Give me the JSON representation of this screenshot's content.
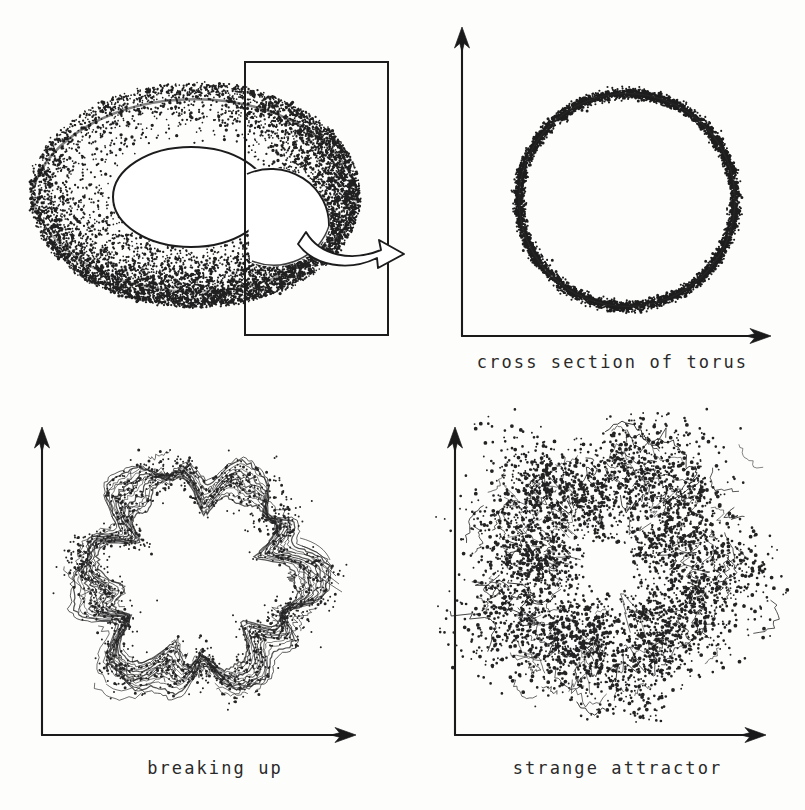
{
  "figure": {
    "background_color": "#fdfdfc",
    "ink_color": "#1a1a1a",
    "width": 805,
    "height": 810
  },
  "panels": [
    {
      "id": "torus",
      "name": "torus-with-cutting-plane",
      "caption": "",
      "has_axes": false,
      "elements": {
        "torus_label": "stippled torus",
        "cutting_plane_label": "cutting plane rectangle",
        "cut_face_label": "circular cut face",
        "arrow_label": "curved block arrow"
      }
    },
    {
      "id": "cross-section",
      "name": "cross-section-of-torus",
      "caption": "cross section of torus",
      "has_axes": true,
      "elements": {
        "curve_label": "dense circular ring of points"
      }
    },
    {
      "id": "breaking-up",
      "name": "breaking-up",
      "caption": "breaking up",
      "has_axes": true,
      "elements": {
        "curve_label": "wrinkled folded ring with wisps"
      }
    },
    {
      "id": "strange-attractor",
      "name": "strange-attractor",
      "caption": "strange attractor",
      "has_axes": true,
      "elements": {
        "curve_label": "diffuse fragmented annulus of dots and squiggles"
      }
    }
  ],
  "chart_data": {
    "type": "scatter",
    "panel_count": 4,
    "axis_ranges": {
      "x": [
        0,
        1
      ],
      "y": [
        0,
        1
      ]
    },
    "grid": false,
    "legend": false,
    "series": [
      {
        "name": "cross section of torus",
        "description": "invariant closed curve (quasi-periodic, smooth circle)",
        "center": [
          0.5,
          0.55
        ],
        "radius": 0.31,
        "radial_noise": 0.012,
        "point_count": 1500
      },
      {
        "name": "breaking up",
        "description": "wrinkled invariant curve beginning to fold and lose smoothness",
        "center": [
          0.5,
          0.52
        ],
        "radius": 0.3,
        "radial_noise": 0.075,
        "wrinkle_harmonics": [
          6,
          11,
          17
        ],
        "point_count": 900
      },
      {
        "name": "strange attractor",
        "description": "fractal chaotic attractor, annulus filled with scattered points",
        "center": [
          0.5,
          0.52
        ],
        "radius": 0.3,
        "radial_noise": 0.2,
        "point_count": 1400
      }
    ]
  }
}
